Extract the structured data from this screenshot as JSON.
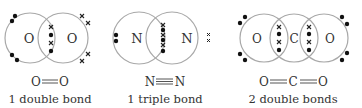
{
  "colors": {
    "circle": "#a8a8a8",
    "electron_dot": "#111111",
    "electron_cross": "#222222",
    "text": "#333333"
  },
  "molecules": [
    {
      "id": "oxygen",
      "atoms": [
        "O",
        "O"
      ],
      "formula": [
        "O",
        "O"
      ],
      "bond_symbol": "double",
      "caption": "1 double bond",
      "shared_electrons": [
        "x",
        "dot",
        "x",
        "dot"
      ]
    },
    {
      "id": "nitrogen",
      "atoms": [
        "N",
        "N"
      ],
      "formula": [
        "N",
        "N"
      ],
      "bond_symbol": "triple",
      "caption": "1 triple bond",
      "shared_electrons": [
        "x",
        "dot",
        "x",
        "dot",
        "x",
        "dot"
      ]
    },
    {
      "id": "carbon-dioxide",
      "atoms": [
        "O",
        "C",
        "O"
      ],
      "formula": [
        "O",
        "C",
        "O"
      ],
      "bond_symbol": "double",
      "caption": "2 double bonds",
      "shared_electrons": [
        "x",
        "dot",
        "x",
        "dot"
      ]
    }
  ]
}
